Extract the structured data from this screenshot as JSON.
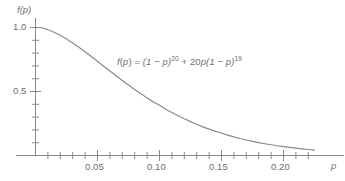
{
  "chart_data": {
    "type": "line",
    "title": "",
    "subtitle": "",
    "xlabel": "p",
    "ylabel": "f(p)",
    "xlim": [
      -0.003,
      0.2255
    ],
    "ylim": [
      0,
      1.09
    ],
    "grid": false,
    "legend": null,
    "annotations": [
      {
        "id": "curve-formula",
        "text": "f(p) = (1 − p)20 + 20p(1 − p)19",
        "latex": "f(p) = (1-p)^{20} + 20p(1-p)^{19}",
        "x": 0.073,
        "y": 0.74
      }
    ],
    "x_ticks_major": [
      0.05,
      0.1,
      0.15,
      0.2
    ],
    "x_tick_labels": [
      "0.05",
      "0.10",
      "0.15",
      "0.20"
    ],
    "x_ticks_minor": [
      0.01,
      0.02,
      0.03,
      0.04,
      0.06,
      0.07,
      0.08,
      0.09,
      0.11,
      0.12,
      0.13,
      0.14,
      0.16,
      0.17,
      0.18,
      0.19,
      0.21,
      0.22
    ],
    "y_ticks_major": [
      0.5,
      1.0
    ],
    "y_tick_labels": [
      "0.5",
      "1.0"
    ],
    "y_ticks_minor": [
      0.1,
      0.2,
      0.3,
      0.4,
      0.6,
      0.7,
      0.8,
      0.9
    ],
    "series": [
      {
        "name": "f(p) = (1-p)^20 + 20p(1-p)^19",
        "color": "#8a8a8a",
        "x": [
          0.0,
          0.005,
          0.01,
          0.015,
          0.02,
          0.025,
          0.03,
          0.035,
          0.04,
          0.045,
          0.05,
          0.055,
          0.06,
          0.065,
          0.07,
          0.075,
          0.08,
          0.085,
          0.09,
          0.095,
          0.1,
          0.105,
          0.11,
          0.115,
          0.12,
          0.125,
          0.13,
          0.135,
          0.14,
          0.145,
          0.15,
          0.155,
          0.16,
          0.165,
          0.17,
          0.175,
          0.18,
          0.185,
          0.19,
          0.195,
          0.2,
          0.205,
          0.21,
          0.215,
          0.22,
          0.225
        ],
        "y": [
          1.0,
          0.998,
          0.983,
          0.963,
          0.94,
          0.911,
          0.879,
          0.845,
          0.81,
          0.773,
          0.736,
          0.698,
          0.66,
          0.623,
          0.586,
          0.55,
          0.516,
          0.482,
          0.45,
          0.419,
          0.392,
          0.362,
          0.336,
          0.311,
          0.287,
          0.265,
          0.244,
          0.224,
          0.206,
          0.189,
          0.176,
          0.159,
          0.145,
          0.133,
          0.121,
          0.111,
          0.101,
          0.092,
          0.084,
          0.076,
          0.069,
          0.063,
          0.057,
          0.052,
          0.047,
          0.042
        ]
      }
    ]
  },
  "axes": {
    "y_axis_label": "f(p)",
    "x_axis_label": "p",
    "y_label_one": "1.0",
    "y_label_half": "0.5",
    "x_label_005": "0.05",
    "x_label_010": "0.10",
    "x_label_015": "0.15",
    "x_label_020": "0.20"
  },
  "formula": {
    "fn_name": "f",
    "open_paren": "(",
    "var": "p",
    "close_paren": ")",
    "equals": " = ",
    "term1_base": "(1 − p)",
    "term1_exp": "20",
    "plus": " + ",
    "term2_coef": "20",
    "term2_var": "p",
    "term2_base": "(1 − p)",
    "term2_exp": "19",
    "plain": "f(p) = (1 − p)20 + 20p(1 − p)19"
  },
  "colors": {
    "curve": "#8a8a8a",
    "axis": "#8a8a8a",
    "text": "#6e6e6e",
    "background": "#ffffff"
  }
}
